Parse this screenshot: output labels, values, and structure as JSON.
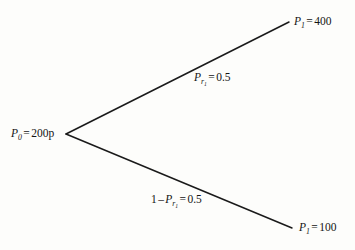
{
  "diagram": {
    "type": "probability-tree",
    "background_color": "#fdfdfb",
    "line_color": "#1a1a1a",
    "root": {
      "symbol": "P",
      "subscript": "0",
      "equals": "=",
      "value": "200p",
      "full_text": "P0 = 200p"
    },
    "branches": [
      {
        "id": "up",
        "direction": "up",
        "probability_label": {
          "symbol": "P",
          "subscript": "r",
          "sub_subscript": "1",
          "equals": "=",
          "value": "0.5",
          "full_text": "Pr1 = 0.5"
        },
        "outcome": {
          "symbol": "P",
          "subscript": "1",
          "equals": "=",
          "value": "400",
          "full_text": "P1 = 400"
        }
      },
      {
        "id": "down",
        "direction": "down",
        "probability_label": {
          "prefix": "1",
          "minus": "–",
          "symbol": "P",
          "subscript": "r",
          "sub_subscript": "1",
          "equals": "=",
          "value": "0.5",
          "full_text": "1 – Pr1 = 0.5"
        },
        "outcome": {
          "symbol": "P",
          "subscript": "1",
          "equals": "=",
          "value": "100",
          "full_text": "P1 = 100"
        }
      }
    ],
    "geometry": {
      "vertex": {
        "x": 66,
        "y": 134
      },
      "up_end": {
        "x": 289,
        "y": 22
      },
      "down_end": {
        "x": 292,
        "y": 228
      }
    }
  }
}
